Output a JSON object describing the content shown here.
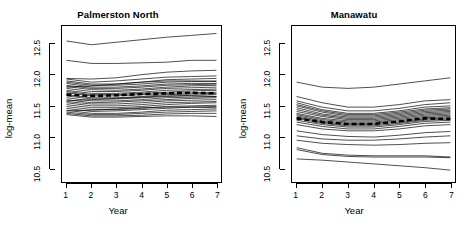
{
  "figure": {
    "background": "#ffffff",
    "line_color": "#000000",
    "mean_line_color": "#000000",
    "panel_count": 2
  },
  "chart_data": [
    {
      "type": "line",
      "title": "Palmerston North",
      "xlabel": "Year",
      "ylabel": "log-mean",
      "x": [
        1,
        2,
        3,
        4,
        5,
        6,
        7
      ],
      "xlim": [
        0.82,
        7.18
      ],
      "ylim": [
        10.28,
        12.78
      ],
      "xticks": [
        1,
        2,
        3,
        4,
        5,
        6,
        7
      ],
      "xtick_labels": [
        "1",
        "2",
        "3",
        "4",
        "5",
        "6",
        "7"
      ],
      "yticks": [
        10.5,
        11.0,
        11.5,
        12.0,
        12.5
      ],
      "ytick_labels": [
        "10.5",
        "11.0",
        "11.5",
        "12.0",
        "12.5"
      ],
      "grid": false,
      "legend": "none",
      "series": [
        {
          "name": "unit-01",
          "values": [
            12.54,
            12.48,
            12.52,
            12.56,
            12.6,
            12.63,
            12.66
          ]
        },
        {
          "name": "unit-02",
          "values": [
            12.23,
            12.18,
            12.18,
            12.19,
            12.2,
            12.23,
            12.23
          ]
        },
        {
          "name": "unit-03",
          "values": [
            11.94,
            11.93,
            11.95,
            12.0,
            12.04,
            12.06,
            12.07
          ]
        },
        {
          "name": "unit-04",
          "values": [
            11.93,
            11.88,
            11.9,
            11.93,
            11.96,
            11.97,
            11.98
          ]
        },
        {
          "name": "unit-05",
          "values": [
            11.9,
            11.85,
            11.85,
            11.88,
            11.92,
            11.93,
            11.94
          ]
        },
        {
          "name": "unit-06",
          "values": [
            11.88,
            11.83,
            11.83,
            11.85,
            11.88,
            11.89,
            11.9
          ]
        },
        {
          "name": "unit-07",
          "values": [
            11.86,
            11.8,
            11.8,
            11.82,
            11.85,
            11.86,
            11.86
          ]
        },
        {
          "name": "unit-08",
          "values": [
            11.83,
            11.78,
            11.78,
            11.8,
            11.83,
            11.84,
            11.85
          ]
        },
        {
          "name": "unit-09",
          "values": [
            11.81,
            11.76,
            11.75,
            11.77,
            11.8,
            11.82,
            11.83
          ]
        },
        {
          "name": "unit-10",
          "values": [
            11.78,
            11.73,
            11.73,
            11.75,
            11.78,
            11.79,
            11.8
          ]
        },
        {
          "name": "unit-11",
          "values": [
            11.75,
            11.7,
            11.7,
            11.72,
            11.75,
            11.76,
            11.77
          ]
        },
        {
          "name": "unit-12",
          "values": [
            11.73,
            11.68,
            11.68,
            11.7,
            11.72,
            11.74,
            11.75
          ]
        },
        {
          "name": "unit-13",
          "values": [
            11.71,
            11.66,
            11.66,
            11.68,
            11.7,
            11.71,
            11.72
          ]
        },
        {
          "name": "unit-14",
          "values": [
            11.68,
            11.63,
            11.63,
            11.65,
            11.68,
            11.69,
            11.7
          ]
        },
        {
          "name": "unit-15",
          "values": [
            11.66,
            11.61,
            11.61,
            11.63,
            11.65,
            11.67,
            11.68
          ]
        },
        {
          "name": "unit-16",
          "values": [
            11.63,
            11.58,
            11.58,
            11.6,
            11.63,
            11.64,
            11.65
          ]
        },
        {
          "name": "unit-17",
          "values": [
            11.6,
            11.55,
            11.56,
            11.58,
            11.6,
            11.62,
            11.63
          ]
        },
        {
          "name": "unit-18",
          "values": [
            11.57,
            11.53,
            11.53,
            11.55,
            11.58,
            11.59,
            11.6
          ]
        },
        {
          "name": "unit-19",
          "values": [
            11.55,
            11.5,
            11.5,
            11.52,
            11.55,
            11.56,
            11.57
          ]
        },
        {
          "name": "unit-20",
          "values": [
            11.52,
            11.47,
            11.47,
            11.49,
            11.52,
            11.54,
            11.55
          ]
        },
        {
          "name": "unit-21",
          "values": [
            11.49,
            11.44,
            11.44,
            11.46,
            11.49,
            11.5,
            11.51
          ]
        },
        {
          "name": "unit-22",
          "values": [
            11.46,
            11.41,
            11.42,
            11.44,
            11.46,
            11.48,
            11.49
          ]
        },
        {
          "name": "unit-23",
          "values": [
            11.43,
            11.38,
            11.38,
            11.4,
            11.43,
            11.44,
            11.45
          ]
        },
        {
          "name": "unit-24",
          "values": [
            11.4,
            11.36,
            11.36,
            11.38,
            11.4,
            11.41,
            11.42
          ]
        },
        {
          "name": "unit-25",
          "values": [
            11.38,
            11.34,
            11.34,
            11.35,
            11.37,
            11.38,
            11.38
          ]
        },
        {
          "name": "unit-26",
          "values": [
            11.36,
            11.32,
            11.32,
            11.33,
            11.34,
            11.34,
            11.33
          ]
        },
        {
          "name": "unit-27",
          "values": [
            11.42,
            11.43,
            11.45,
            11.47,
            11.48,
            11.48,
            11.47
          ]
        },
        {
          "name": "unit-28",
          "values": [
            11.58,
            11.6,
            11.62,
            11.64,
            11.66,
            11.66,
            11.65
          ]
        },
        {
          "name": "unit-29",
          "values": [
            11.8,
            11.82,
            11.85,
            11.88,
            11.9,
            11.9,
            11.89
          ]
        }
      ],
      "mean_series": {
        "name": "overall-mean",
        "style": "thick-dashed",
        "values": [
          11.68,
          11.66,
          11.67,
          11.69,
          11.7,
          11.71,
          11.7
        ]
      }
    },
    {
      "type": "line",
      "title": "Manawatu",
      "xlabel": "Year",
      "ylabel": "log-mean",
      "x": [
        1,
        2,
        3,
        4,
        5,
        6,
        7
      ],
      "xlim": [
        0.82,
        7.18
      ],
      "ylim": [
        10.28,
        12.78
      ],
      "xticks": [
        1,
        2,
        3,
        4,
        5,
        6,
        7
      ],
      "xtick_labels": [
        "1",
        "2",
        "3",
        "4",
        "5",
        "6",
        "7"
      ],
      "yticks": [
        10.5,
        11.0,
        11.5,
        12.0,
        12.5
      ],
      "ytick_labels": [
        "10.5",
        "11.0",
        "11.5",
        "12.0",
        "12.5"
      ],
      "grid": false,
      "legend": "none",
      "series": [
        {
          "name": "unit-01",
          "values": [
            11.88,
            11.8,
            11.78,
            11.8,
            11.85,
            11.9,
            11.95
          ]
        },
        {
          "name": "unit-02",
          "values": [
            11.65,
            11.55,
            11.48,
            11.48,
            11.52,
            11.58,
            11.6
          ]
        },
        {
          "name": "unit-03",
          "values": [
            11.58,
            11.48,
            11.42,
            11.42,
            11.46,
            11.52,
            11.55
          ]
        },
        {
          "name": "unit-04",
          "values": [
            11.55,
            11.44,
            11.38,
            11.38,
            11.42,
            11.48,
            11.5
          ]
        },
        {
          "name": "unit-05",
          "values": [
            11.52,
            11.42,
            11.36,
            11.36,
            11.4,
            11.45,
            11.47
          ]
        },
        {
          "name": "unit-06",
          "values": [
            11.5,
            11.4,
            11.34,
            11.34,
            11.38,
            11.43,
            11.45
          ]
        },
        {
          "name": "unit-07",
          "values": [
            11.47,
            11.37,
            11.32,
            11.32,
            11.36,
            11.41,
            11.43
          ]
        },
        {
          "name": "unit-08",
          "values": [
            11.44,
            11.35,
            11.3,
            11.3,
            11.34,
            11.39,
            11.41
          ]
        },
        {
          "name": "unit-09",
          "values": [
            11.41,
            11.33,
            11.28,
            11.28,
            11.32,
            11.37,
            11.39
          ]
        },
        {
          "name": "unit-10",
          "values": [
            11.38,
            11.3,
            11.26,
            11.26,
            11.3,
            11.35,
            11.37
          ]
        },
        {
          "name": "unit-11",
          "values": [
            11.36,
            11.28,
            11.24,
            11.24,
            11.28,
            11.33,
            11.35
          ]
        },
        {
          "name": "unit-12",
          "values": [
            11.34,
            11.26,
            11.22,
            11.22,
            11.26,
            11.31,
            11.33
          ]
        },
        {
          "name": "unit-13",
          "values": [
            11.32,
            11.24,
            11.2,
            11.2,
            11.24,
            11.29,
            11.31
          ]
        },
        {
          "name": "unit-14",
          "values": [
            11.3,
            11.22,
            11.18,
            11.18,
            11.22,
            11.27,
            11.29
          ]
        },
        {
          "name": "unit-15",
          "values": [
            11.27,
            11.2,
            11.16,
            11.16,
            11.2,
            11.25,
            11.27
          ]
        },
        {
          "name": "unit-16",
          "values": [
            11.24,
            11.17,
            11.13,
            11.13,
            11.17,
            11.22,
            11.24
          ]
        },
        {
          "name": "unit-17",
          "values": [
            11.2,
            11.13,
            11.1,
            11.1,
            11.13,
            11.18,
            11.2
          ]
        },
        {
          "name": "unit-18",
          "values": [
            11.1,
            11.04,
            11.01,
            11.0,
            11.03,
            11.07,
            11.09
          ]
        },
        {
          "name": "unit-19",
          "values": [
            11.02,
            10.97,
            10.95,
            10.95,
            10.97,
            11.0,
            11.02
          ]
        },
        {
          "name": "unit-20",
          "values": [
            10.95,
            10.9,
            10.88,
            10.87,
            10.88,
            10.9,
            10.91
          ]
        },
        {
          "name": "unit-21",
          "values": [
            10.83,
            10.74,
            10.71,
            10.7,
            10.7,
            10.7,
            10.68
          ]
        },
        {
          "name": "unit-22",
          "values": [
            10.8,
            10.72,
            10.69,
            10.68,
            10.68,
            10.68,
            10.67
          ]
        },
        {
          "name": "unit-23",
          "values": [
            10.65,
            10.63,
            10.6,
            10.57,
            10.54,
            10.51,
            10.47
          ]
        }
      ],
      "mean_series": {
        "name": "overall-mean",
        "style": "thick-dashed",
        "values": [
          11.3,
          11.24,
          11.21,
          11.21,
          11.25,
          11.3,
          11.29
        ]
      }
    }
  ]
}
